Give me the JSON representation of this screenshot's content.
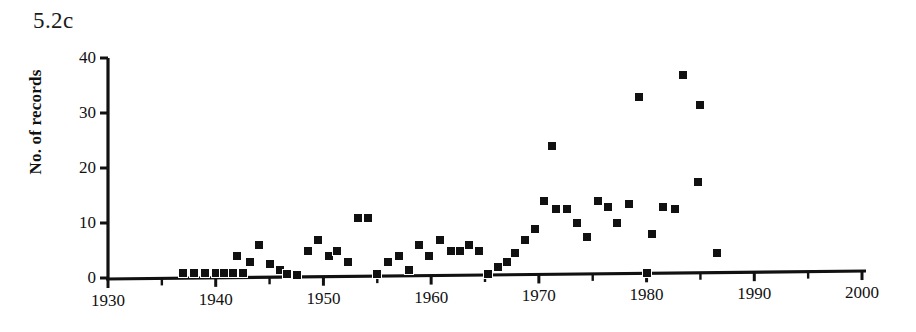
{
  "figure": {
    "title": "5.2c"
  },
  "chart_data": {
    "type": "scatter",
    "title": "5.2c",
    "xlabel": "",
    "ylabel": "No. of records",
    "xlim": [
      1930,
      2000
    ],
    "ylim": [
      0,
      40
    ],
    "x_ticks": [
      1930,
      1940,
      1950,
      1960,
      1970,
      1980,
      1990,
      2000
    ],
    "x_tick_labels": [
      "1930",
      "1940",
      "1950",
      "1960",
      "1970",
      "1980",
      "1990",
      "2000"
    ],
    "x_minor_ticks": [
      1935,
      1945,
      1955,
      1965,
      1975,
      1985,
      1995
    ],
    "y_ticks": [
      0,
      10,
      20,
      30,
      40
    ],
    "y_tick_labels": [
      "0",
      "10",
      "20",
      "30",
      "40"
    ],
    "grid": false,
    "legend": null,
    "marker": "square",
    "marker_color": "#111111",
    "marker_size_px": 8,
    "points": [
      {
        "x": 1937.0,
        "y": 1.0
      },
      {
        "x": 1938.0,
        "y": 1.0
      },
      {
        "x": 1939.0,
        "y": 1.0
      },
      {
        "x": 1940.0,
        "y": 1.0
      },
      {
        "x": 1940.8,
        "y": 1.0
      },
      {
        "x": 1941.6,
        "y": 1.0
      },
      {
        "x": 1942.5,
        "y": 1.0
      },
      {
        "x": 1942.0,
        "y": 4.0
      },
      {
        "x": 1943.2,
        "y": 3.0
      },
      {
        "x": 1944.0,
        "y": 6.0
      },
      {
        "x": 1945.0,
        "y": 2.5
      },
      {
        "x": 1946.0,
        "y": 1.5
      },
      {
        "x": 1946.6,
        "y": 0.8
      },
      {
        "x": 1947.5,
        "y": 0.5
      },
      {
        "x": 1948.6,
        "y": 5.0
      },
      {
        "x": 1949.5,
        "y": 7.0
      },
      {
        "x": 1950.5,
        "y": 4.0
      },
      {
        "x": 1951.3,
        "y": 5.0
      },
      {
        "x": 1952.3,
        "y": 3.0
      },
      {
        "x": 1953.2,
        "y": 11.0
      },
      {
        "x": 1954.1,
        "y": 11.0
      },
      {
        "x": 1955.0,
        "y": 0.8
      },
      {
        "x": 1956.0,
        "y": 3.0
      },
      {
        "x": 1957.0,
        "y": 4.0
      },
      {
        "x": 1957.9,
        "y": 1.5
      },
      {
        "x": 1958.9,
        "y": 6.0
      },
      {
        "x": 1959.8,
        "y": 4.0
      },
      {
        "x": 1960.8,
        "y": 7.0
      },
      {
        "x": 1961.8,
        "y": 5.0
      },
      {
        "x": 1962.7,
        "y": 5.0
      },
      {
        "x": 1963.5,
        "y": 6.0
      },
      {
        "x": 1964.4,
        "y": 5.0
      },
      {
        "x": 1965.3,
        "y": 0.8
      },
      {
        "x": 1966.2,
        "y": 2.0
      },
      {
        "x": 1967.0,
        "y": 3.0
      },
      {
        "x": 1967.8,
        "y": 4.5
      },
      {
        "x": 1968.7,
        "y": 7.0
      },
      {
        "x": 1969.6,
        "y": 9.0
      },
      {
        "x": 1970.5,
        "y": 14.0
      },
      {
        "x": 1971.2,
        "y": 24.0
      },
      {
        "x": 1971.6,
        "y": 12.5
      },
      {
        "x": 1972.6,
        "y": 12.5
      },
      {
        "x": 1973.5,
        "y": 10.0
      },
      {
        "x": 1974.5,
        "y": 7.5
      },
      {
        "x": 1975.5,
        "y": 14.0
      },
      {
        "x": 1976.4,
        "y": 13.0
      },
      {
        "x": 1977.3,
        "y": 10.0
      },
      {
        "x": 1978.4,
        "y": 13.5
      },
      {
        "x": 1979.3,
        "y": 33.0
      },
      {
        "x": 1980.0,
        "y": 1.0
      },
      {
        "x": 1980.5,
        "y": 8.0
      },
      {
        "x": 1981.5,
        "y": 13.0
      },
      {
        "x": 1983.4,
        "y": 37.0
      },
      {
        "x": 1982.6,
        "y": 12.5
      },
      {
        "x": 1985.0,
        "y": 31.5
      },
      {
        "x": 1984.8,
        "y": 17.5
      },
      {
        "x": 1986.5,
        "y": 4.5
      }
    ]
  }
}
